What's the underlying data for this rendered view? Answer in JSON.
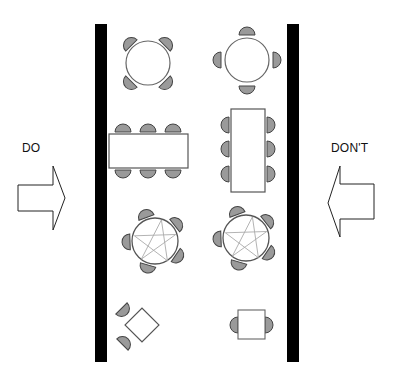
{
  "labels": {
    "do": "DO",
    "dont": "DON'T"
  },
  "colors": {
    "wall": "#000000",
    "chair_fill": "#9a9a9a",
    "chair_stroke": "#444444",
    "table_fill": "#ffffff",
    "table_stroke": "#555555",
    "pentagram": "#aaaaaa",
    "arrow_stroke": "#222222"
  },
  "layout_do_side": {
    "round_table_chairs": 4,
    "long_table_chairs": 6,
    "pentagon_table_chairs": 5,
    "square_table_chairs": 2
  },
  "layout_dont_side": {
    "round_table_chairs": 4,
    "long_table_chairs": 6,
    "pentagon_table_chairs": 5,
    "square_table_chairs": 2
  }
}
